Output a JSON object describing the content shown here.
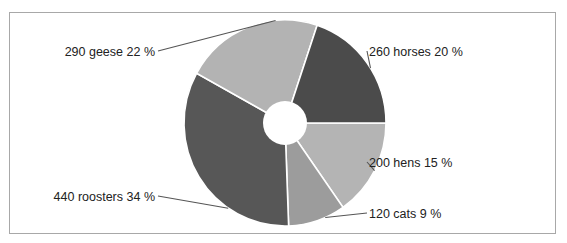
{
  "chart_data": {
    "type": "pie",
    "style": "donut",
    "title": "",
    "start": "3 o'clock, clockwise",
    "slices": [
      {
        "name": "hens",
        "value": 200,
        "percent": 15,
        "label": "200 hens 15 %",
        "color": "#b4b4b4"
      },
      {
        "name": "cats",
        "value": 120,
        "percent": 9,
        "label": "120 cats 9 %",
        "color": "#9c9c9c"
      },
      {
        "name": "roosters",
        "value": 440,
        "percent": 34,
        "label": "440 roosters 34 %",
        "color": "#575757"
      },
      {
        "name": "geese",
        "value": 290,
        "percent": 22,
        "label": "290 geese 22 %",
        "color": "#b3b3b3"
      },
      {
        "name": "horses",
        "value": 260,
        "percent": 20,
        "label": "260 horses 20 %",
        "color": "#4b4b4b"
      }
    ],
    "legend": "none (labels on slices via leader lines)"
  }
}
